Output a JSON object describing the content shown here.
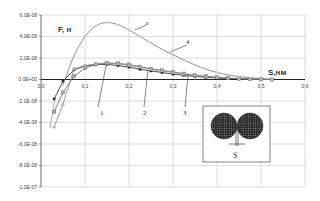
{
  "chart_data": {
    "type": "line",
    "title": "",
    "xlabel": "S,нм",
    "ylabel": "F, н",
    "xlim": [
      0.0,
      0.6
    ],
    "ylim": [
      -1e-07,
      6e-08
    ],
    "grid": true,
    "x_ticks": [
      "0.0",
      "0.1",
      "0.2",
      "0.3",
      "0.4",
      "0.5",
      "0.6"
    ],
    "y_ticks": [
      "6.0E-08",
      "4.0E-08",
      "2.0E-08",
      "0.0E+00",
      "-2.0E-08",
      "-4.0E-08",
      "-6.0E-08",
      "-8.0E-08",
      "-1.0E-07"
    ],
    "series": [
      {
        "name": "1",
        "marker": "diamond",
        "x": [
          0.03,
          0.05,
          0.075,
          0.1,
          0.125,
          0.15,
          0.175,
          0.2,
          0.225,
          0.25,
          0.275,
          0.3,
          0.325,
          0.35,
          0.375,
          0.4,
          0.425,
          0.45,
          0.475,
          0.5,
          0.525
        ],
        "y": [
          -1.8e-08,
          -1.5e-09,
          9e-09,
          1.25e-08,
          1.4e-08,
          1.4e-08,
          1.3e-08,
          1.15e-08,
          9.5e-09,
          8e-09,
          6.5e-09,
          5e-09,
          3.8e-09,
          2.8e-09,
          2e-09,
          1.4e-09,
          9e-10,
          6e-10,
          3e-10,
          1e-10,
          0
        ]
      },
      {
        "name": "2",
        "marker": "square",
        "x": [
          0.03,
          0.05,
          0.075,
          0.1,
          0.125,
          0.15,
          0.175,
          0.2,
          0.225,
          0.25,
          0.275,
          0.3,
          0.325,
          0.35,
          0.375,
          0.4,
          0.425,
          0.45,
          0.475,
          0.5,
          0.525
        ],
        "y": [
          -3e-08,
          -1.2e-08,
          3e-09,
          1.05e-08,
          1.4e-08,
          1.55e-08,
          1.5e-08,
          1.4e-08,
          1.2e-08,
          1e-08,
          8.5e-09,
          7e-09,
          5.5e-09,
          4e-09,
          3e-09,
          2e-09,
          1.4e-09,
          9e-10,
          5e-10,
          2e-10,
          0
        ]
      },
      {
        "name": "3",
        "marker": "triangle",
        "x": [
          0.03,
          0.05,
          0.075,
          0.1,
          0.125,
          0.15,
          0.175,
          0.2,
          0.225,
          0.25,
          0.275,
          0.3,
          0.325,
          0.35,
          0.375,
          0.4,
          0.425,
          0.45,
          0.475,
          0.5,
          0.525
        ],
        "y": [
          -4.4e-08,
          -2.3e-08,
          1e-08,
          1.3e-08,
          1.45e-08,
          1.5e-08,
          1.45e-08,
          1.3e-08,
          1.15e-08,
          9.5e-09,
          8e-09,
          6.5e-09,
          5e-09,
          3.8e-09,
          2.8e-09,
          1.9e-09,
          1.2e-09,
          7e-10,
          4e-10,
          2e-10,
          0
        ]
      },
      {
        "name": "4",
        "marker": "circle",
        "x": [
          0.05,
          0.075,
          0.1,
          0.125,
          0.15,
          0.175,
          0.2,
          0.225,
          0.25,
          0.275,
          0.3,
          0.325,
          0.35,
          0.375,
          0.4,
          0.425,
          0.45,
          0.475,
          0.5,
          0.525
        ],
        "y": [
          -5e-09,
          2.2e-08,
          4e-08,
          5e-08,
          5.3e-08,
          5.1e-08,
          4.6e-08,
          4e-08,
          3.4e-08,
          2.8e-08,
          2.3e-08,
          1.8e-08,
          1.35e-08,
          9.5e-09,
          6.5e-09,
          4.3e-09,
          2.8e-09,
          1.6e-09,
          8e-10,
          2e-10
        ]
      }
    ],
    "annotations": [
      "1",
      "2",
      "3",
      "4",
      "ε",
      "S"
    ],
    "inset": {
      "description": "two spherical nanoparticles separated by distance S",
      "label": "S"
    }
  }
}
